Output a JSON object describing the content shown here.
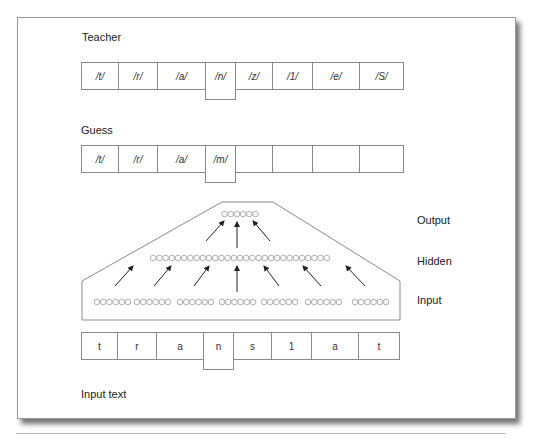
{
  "diagram": {
    "teacher": {
      "label": "Teacher",
      "cells": [
        "/t/",
        "/r/",
        "/a/",
        "/n/",
        "/z/",
        "/1/",
        "/e/",
        "/S/"
      ],
      "focus_index": 3
    },
    "guess": {
      "label": "Guess",
      "cells": [
        "/t/",
        "/r/",
        "/a/",
        "/m/",
        "",
        "",
        "",
        ""
      ],
      "focus_index": 3
    },
    "network": {
      "layers": [
        {
          "name": "Output",
          "units": 6
        },
        {
          "name": "Hidden",
          "units": 29
        },
        {
          "name": "Input",
          "groups": 7,
          "units_per_group": 6
        }
      ]
    },
    "input_text": {
      "label": "Input text",
      "cells": [
        "t",
        "r",
        "a",
        "n",
        "s",
        "1",
        "a",
        "t"
      ],
      "focus_index": 3
    }
  },
  "colors": {
    "line": "#8a8a8a",
    "circle": "#9a9a9a",
    "arrow": "#222222",
    "text": "#222222"
  }
}
